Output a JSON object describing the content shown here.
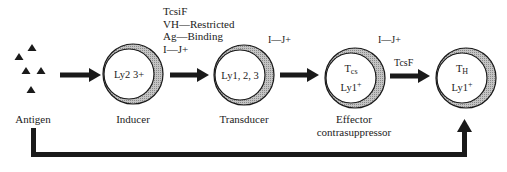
{
  "diagram": {
    "antigen": {
      "label": "Antigen"
    },
    "cells": [
      {
        "id": "inducer",
        "inner_main": "Ly2 3+",
        "inner_sub": "",
        "inner_line2": "",
        "label": "Inducer"
      },
      {
        "id": "transducer",
        "inner_main": "Ly1, 2, 3",
        "inner_sub": "",
        "inner_line2": "",
        "label": "Transducer"
      },
      {
        "id": "effector",
        "inner_main": "T",
        "inner_sub": "cs",
        "inner_line2": "Ly1",
        "inner_line2_sup": "+",
        "label_line1": "Effector",
        "label_line2": "contrasuppressor"
      },
      {
        "id": "th",
        "inner_main": "T",
        "inner_sub": "H",
        "inner_line2": "Ly1",
        "inner_line2_sup": "+",
        "label": ""
      }
    ],
    "annotations": {
      "inducer_to_transducer": [
        "TcsiF",
        "VH—Restricted",
        "Ag—Binding",
        "I—J+"
      ],
      "transducer_to_effector": "I—J+",
      "effector_to_th_top": "I—J+",
      "effector_to_th_arrow": "TcsF"
    },
    "colors": {
      "line": "#1a1a1a",
      "ring_fill": "#b8b8b8",
      "background": "#ffffff"
    }
  }
}
